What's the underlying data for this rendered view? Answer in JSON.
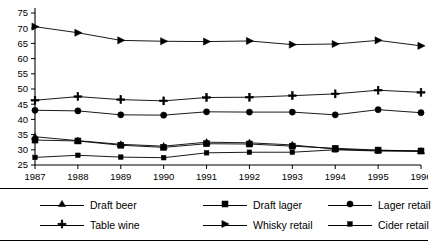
{
  "chart_data": {
    "type": "line",
    "title": "",
    "subtitle": "",
    "xlabel": "",
    "ylabel": "",
    "x": [
      1987,
      1988,
      1989,
      1990,
      1991,
      1992,
      1993,
      1994,
      1995,
      1996
    ],
    "xtick_labels": [
      "1987",
      "1988",
      "1989",
      "1990",
      "1991",
      "1992",
      "1993",
      "1994",
      "1995",
      "1996"
    ],
    "ytick_labels": [
      "25",
      "30",
      "35",
      "40",
      "45",
      "50",
      "55",
      "60",
      "65",
      "70",
      "75"
    ],
    "ytick_values": [
      25,
      30,
      35,
      40,
      45,
      50,
      55,
      60,
      65,
      70,
      75
    ],
    "ylim": [
      25,
      75
    ],
    "xlim": [
      1987,
      1996
    ],
    "grid": false,
    "legend_position": "bottom",
    "legend_columns": 3,
    "legend_rows": 2,
    "series": [
      {
        "name": "Draft beer",
        "marker": "triangle-up",
        "color": "#000000",
        "values": [
          34.3,
          33.0,
          31.8,
          31.2,
          32.5,
          32.3,
          31.6,
          30.2,
          29.8,
          29.6
        ]
      },
      {
        "name": "Draft lager",
        "marker": "square",
        "color": "#000000",
        "values": [
          33.2,
          32.9,
          31.5,
          30.8,
          32.0,
          31.9,
          31.2,
          30.5,
          29.9,
          29.6
        ]
      },
      {
        "name": "Lager retail",
        "marker": "circle",
        "color": "#000000",
        "values": [
          43.0,
          42.8,
          41.5,
          41.4,
          42.5,
          42.4,
          42.4,
          41.5,
          43.2,
          42.2
        ]
      },
      {
        "name": "Table wine",
        "marker": "plus",
        "color": "#000000",
        "values": [
          46.3,
          47.5,
          46.5,
          46.1,
          47.2,
          47.3,
          47.8,
          48.4,
          49.6,
          48.9
        ]
      },
      {
        "name": "Whisky retail",
        "marker": "triangle-right",
        "color": "#000000",
        "values": [
          70.5,
          68.5,
          66.0,
          65.7,
          65.6,
          65.8,
          64.6,
          64.8,
          66.0,
          64.2
        ]
      },
      {
        "name": "Cider retail",
        "marker": "small-square",
        "color": "#000000",
        "values": [
          27.5,
          28.2,
          27.6,
          27.4,
          29.0,
          29.2,
          29.2,
          30.0,
          29.6,
          29.5
        ]
      }
    ]
  },
  "legend": {
    "entries": [
      {
        "label": "Draft beer",
        "marker": "triangle-up",
        "row": 0,
        "col": 0
      },
      {
        "label": "Draft lager",
        "marker": "square",
        "row": 0,
        "col": 1
      },
      {
        "label": "Lager retail",
        "marker": "circle",
        "row": 0,
        "col": 2
      },
      {
        "label": "Table wine",
        "marker": "plus",
        "row": 1,
        "col": 0
      },
      {
        "label": "Whisky retail",
        "marker": "triangle-right",
        "row": 1,
        "col": 1
      },
      {
        "label": "Cider retail",
        "marker": "small-square",
        "row": 1,
        "col": 2
      }
    ]
  }
}
